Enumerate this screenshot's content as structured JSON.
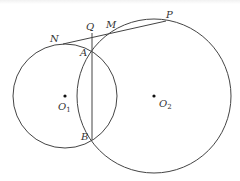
{
  "diagram": {
    "stroke_color": "#444444",
    "point_color": "#111111",
    "circles": [
      {
        "name": "O1",
        "cx": 65,
        "cy": 96,
        "r": 52
      },
      {
        "name": "O2",
        "cx": 154,
        "cy": 96,
        "r": 77
      }
    ],
    "points": {
      "N": {
        "x": 63,
        "y": 44,
        "label": "N",
        "lx": 50,
        "ly": 42
      },
      "Q": {
        "x": 92,
        "y": 33,
        "label": "Q",
        "lx": 86,
        "ly": 30
      },
      "M": {
        "x": 112,
        "y": 31,
        "label": "M",
        "lx": 106,
        "ly": 28
      },
      "P": {
        "x": 166,
        "y": 21,
        "label": "P",
        "lx": 166,
        "ly": 18
      },
      "A": {
        "x": 92,
        "y": 50,
        "label": "A",
        "lx": 80,
        "ly": 56
      },
      "B": {
        "x": 92,
        "y": 140,
        "label": "B",
        "lx": 81,
        "ly": 140
      },
      "O1": {
        "x": 65,
        "y": 96,
        "label": "O",
        "sub": "1",
        "lx": 58,
        "ly": 110
      },
      "O2": {
        "x": 154,
        "y": 96,
        "label": "O",
        "sub": "2",
        "lx": 159,
        "ly": 107
      }
    },
    "segments": [
      {
        "name": "tangent-NP",
        "from": "N",
        "to": "P"
      },
      {
        "name": "chord-QB",
        "from": "Q",
        "to": "B"
      }
    ]
  }
}
